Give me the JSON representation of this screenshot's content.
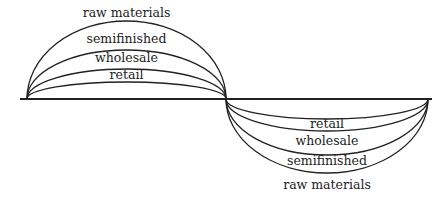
{
  "diagram": {
    "axis": {
      "x1": 20,
      "x2": 432,
      "y": 99,
      "color": "#222222"
    },
    "anchors": {
      "left": 27,
      "middle": 226,
      "right": 428
    },
    "top_arcs": [
      {
        "label": "raw materials",
        "peak_y": 21,
        "label_y": 17
      },
      {
        "label": "semifinished",
        "peak_y": 50,
        "label_y": 43
      },
      {
        "label": "wholesale",
        "peak_y": 69,
        "label_y": 62
      },
      {
        "label": "retail",
        "peak_y": 82,
        "label_y": 79
      }
    ],
    "bottom_arcs": [
      {
        "label": "retail",
        "peak_y": 119,
        "label_y": 128
      },
      {
        "label": "wholesale",
        "peak_y": 131,
        "label_y": 145
      },
      {
        "label": "semifinished",
        "peak_y": 155,
        "label_y": 165
      },
      {
        "label": "raw materials",
        "peak_y": 173,
        "label_y": 189
      }
    ],
    "stroke_color": "#222222"
  }
}
